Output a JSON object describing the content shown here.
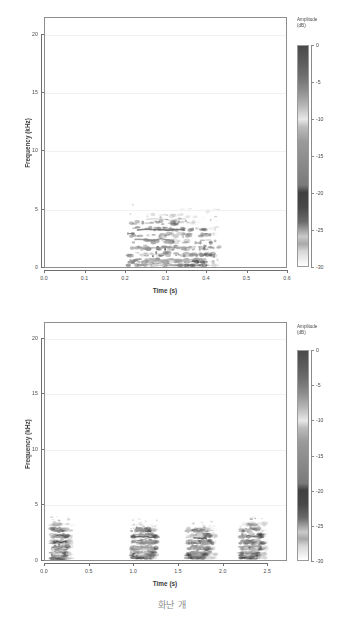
{
  "caption": {
    "text": "화난 개"
  },
  "colors": {
    "frame": "#8e8e8e",
    "axis": "#6f6f6f",
    "grid": "#f1f1f1",
    "text": "#4a4a4a",
    "caption": "#8d8d8d",
    "ink_dark": "#3b3b3b",
    "background": "#ffffff"
  },
  "colorbar": {
    "title_line1": "Amplitude",
    "title_line2": "(dB)",
    "ticks": [
      0,
      -5,
      -10,
      -15,
      -20,
      -25,
      -30
    ],
    "tick_labels": [
      "0",
      "-5",
      "-10",
      "-15",
      "-20",
      "-25",
      "-30"
    ],
    "vmin": -30,
    "vmax": 0,
    "stops": [
      {
        "db": 0,
        "color": "#4a4a4a"
      },
      {
        "db": -2,
        "color": "#5a5a5a"
      },
      {
        "db": -4,
        "color": "#6e6e6e"
      },
      {
        "db": -6,
        "color": "#8c8c8c"
      },
      {
        "db": -8,
        "color": "#b4b4b4"
      },
      {
        "db": -10,
        "color": "#e8e8e8"
      },
      {
        "db": -11,
        "color": "#bdbdbd"
      },
      {
        "db": -13,
        "color": "#9a9a9a"
      },
      {
        "db": -16,
        "color": "#8a8a8a"
      },
      {
        "db": -19,
        "color": "#7a7a7a"
      },
      {
        "db": -20,
        "color": "#3f3f3f"
      },
      {
        "db": -22,
        "color": "#484848"
      },
      {
        "db": -24,
        "color": "#6a6a6a"
      },
      {
        "db": -25,
        "color": "#9b9b9b"
      },
      {
        "db": -26,
        "color": "#c9c9c9"
      },
      {
        "db": -27,
        "color": "#a8a8a8"
      },
      {
        "db": -28,
        "color": "#d6d6d6"
      },
      {
        "db": -30,
        "color": "#ffffff"
      }
    ]
  },
  "chart_data": [
    {
      "id": "spectrogram-top",
      "type": "heatmap",
      "title": "",
      "xlabel": "Time (s)",
      "ylabel": "Frequency (kHz)",
      "xlim": [
        0.0,
        0.6
      ],
      "ylim": [
        0,
        21.5
      ],
      "xticks": [
        0.0,
        0.1,
        0.2,
        0.3,
        0.4,
        0.5,
        0.6
      ],
      "xtick_labels": [
        "0.0",
        "0.1",
        "0.2",
        "0.3",
        "0.4",
        "0.5",
        "0.6"
      ],
      "yticks": [
        0,
        5,
        10,
        15,
        20
      ],
      "ytick_labels": [
        "0",
        "5",
        "10",
        "15",
        "20"
      ],
      "grid": true,
      "colorbar": true,
      "zlabel": "Amplitude (dB)",
      "zlim": [
        -30,
        0
      ],
      "events": [
        {
          "name": "bark-1",
          "t_start": 0.205,
          "t_end": 0.435,
          "f_low": 0.15,
          "f_high": 5.1,
          "peak_t": 0.295,
          "peak_f": 1.6,
          "density": 1.0
        }
      ]
    },
    {
      "id": "spectrogram-bottom",
      "type": "heatmap",
      "title": "",
      "xlabel": "Time (s)",
      "ylabel": "Frequency (kHz)",
      "xlim": [
        0.0,
        2.72
      ],
      "ylim": [
        0,
        21.5
      ],
      "xticks": [
        0.0,
        0.5,
        1.0,
        1.5,
        2.0,
        2.5
      ],
      "xtick_labels": [
        "0.0",
        "0.5",
        "1.0",
        "1.5",
        "2.0",
        "2.5"
      ],
      "yticks": [
        0,
        5,
        10,
        15,
        20
      ],
      "ytick_labels": [
        "0",
        "5",
        "10",
        "15",
        "20"
      ],
      "grid": true,
      "colorbar": true,
      "zlabel": "Amplitude (dB)",
      "zlim": [
        -30,
        0
      ],
      "events": [
        {
          "name": "bark-1",
          "t_start": 0.07,
          "t_end": 0.3,
          "f_low": 0.15,
          "f_high": 3.5,
          "peak_t": 0.14,
          "peak_f": 1.5,
          "density": 1.0
        },
        {
          "name": "bark-2",
          "t_start": 0.97,
          "t_end": 1.27,
          "f_low": 0.2,
          "f_high": 3.3,
          "peak_t": 1.1,
          "peak_f": 1.5,
          "density": 0.95
        },
        {
          "name": "bark-3",
          "t_start": 1.6,
          "t_end": 1.93,
          "f_low": 0.2,
          "f_high": 3.1,
          "peak_t": 1.7,
          "peak_f": 1.5,
          "density": 0.95
        },
        {
          "name": "bark-4",
          "t_start": 2.2,
          "t_end": 2.5,
          "f_low": 0.2,
          "f_high": 3.4,
          "peak_t": 2.3,
          "peak_f": 1.6,
          "density": 0.95
        }
      ]
    }
  ]
}
